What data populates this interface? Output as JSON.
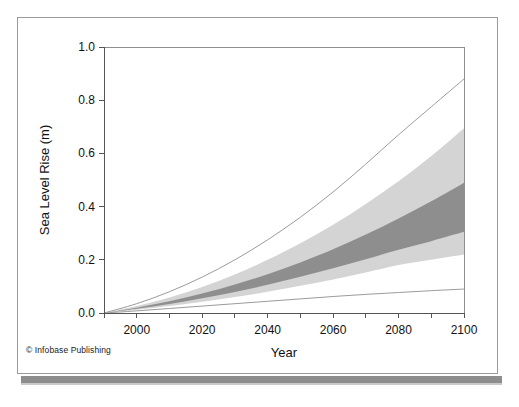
{
  "figure": {
    "credit": "© Infobase Publishing",
    "copyright_symbol": "©"
  },
  "colors": {
    "band_outer": "#d4d4d4",
    "band_inner": "#8e8e8e",
    "envelope_line": "#9b9b9b",
    "axis": "#555555",
    "frame": "#8e8e8e",
    "shadow_bar": "#8d8d8d",
    "background": "#ffffff",
    "text": "#111111"
  },
  "chart_data": {
    "type": "area",
    "title": "",
    "subtitle": "",
    "xlabel": "Year",
    "ylabel": "Sea Level Rise (m)",
    "xlim": [
      1990,
      2100
    ],
    "ylim": [
      0.0,
      1.0
    ],
    "xticks": [
      1990,
      2000,
      2010,
      2020,
      2030,
      2040,
      2050,
      2060,
      2070,
      2080,
      2090,
      2100
    ],
    "xtick_labels": [
      "",
      "2000",
      "",
      "2020",
      "",
      "2040",
      "",
      "2060",
      "",
      "2080",
      "",
      "2100"
    ],
    "xtick_labels_shown": [
      "2000",
      "2020",
      "2040",
      "2060",
      "2080",
      "2100"
    ],
    "yticks": [
      0.0,
      0.2,
      0.4,
      0.6,
      0.8,
      1.0
    ],
    "ytick_labels": [
      "0.0",
      "0.2",
      "0.4",
      "0.6",
      "0.8",
      "1.0"
    ],
    "grid": false,
    "legend": false,
    "legend_position": "none",
    "x": [
      1990,
      2000,
      2010,
      2020,
      2030,
      2040,
      2050,
      2060,
      2070,
      2080,
      2090,
      2100
    ],
    "series": [
      {
        "name": "Maximum envelope (upper bound incl. land-ice uncertainty)",
        "type": "line",
        "values": [
          0.0,
          0.035,
          0.08,
          0.135,
          0.2,
          0.275,
          0.36,
          0.455,
          0.56,
          0.67,
          0.775,
          0.88
        ]
      },
      {
        "name": "Minimum envelope (lower bound)",
        "type": "line",
        "values": [
          0.0,
          0.008,
          0.017,
          0.026,
          0.035,
          0.044,
          0.053,
          0.062,
          0.07,
          0.077,
          0.084,
          0.09
        ]
      },
      {
        "name": "Full model range upper (light gray band top)",
        "type": "band_edge",
        "values": [
          0.0,
          0.026,
          0.058,
          0.098,
          0.145,
          0.2,
          0.262,
          0.332,
          0.41,
          0.495,
          0.59,
          0.695
        ]
      },
      {
        "name": "Full model range lower (light gray band bottom)",
        "type": "band_edge",
        "values": [
          0.0,
          0.012,
          0.026,
          0.042,
          0.06,
          0.08,
          0.102,
          0.126,
          0.152,
          0.18,
          0.2,
          0.22
        ]
      },
      {
        "name": "Likely range upper (dark gray band top)",
        "type": "band_edge",
        "values": [
          0.0,
          0.02,
          0.044,
          0.073,
          0.107,
          0.146,
          0.19,
          0.24,
          0.295,
          0.355,
          0.42,
          0.49
        ]
      },
      {
        "name": "Likely range lower (dark gray band bottom)",
        "type": "band_edge",
        "values": [
          0.0,
          0.016,
          0.034,
          0.055,
          0.079,
          0.106,
          0.136,
          0.168,
          0.202,
          0.238,
          0.27,
          0.305
        ]
      }
    ],
    "bands": [
      {
        "name": "outer-band",
        "fill": "#d4d4d4",
        "upper": "Full model range upper (light gray band top)",
        "lower": "Full model range lower (light gray band bottom)"
      },
      {
        "name": "inner-band",
        "fill": "#8e8e8e",
        "upper": "Likely range upper (dark gray band top)",
        "lower": "Likely range lower (dark gray band bottom)"
      }
    ],
    "annotations": []
  },
  "geometry": {
    "plot_left": 104,
    "plot_right": 464,
    "plot_top": 47,
    "plot_bottom": 313
  }
}
